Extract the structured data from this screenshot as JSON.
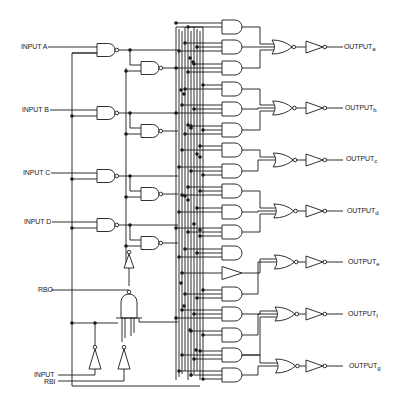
{
  "diagram": {
    "type": "logic-schematic",
    "inputs": [
      {
        "id": "A",
        "label": "INPUT A",
        "y": 47
      },
      {
        "id": "B",
        "label": "INPUT B",
        "y": 110
      },
      {
        "id": "C",
        "label": "INPUT C",
        "y": 173
      },
      {
        "id": "D",
        "label": "INPUT D",
        "y": 222
      }
    ],
    "rbo": {
      "label": "RBO",
      "y": 290
    },
    "rbi": {
      "label_line1": "INPUT",
      "label_line2": "RBI",
      "y1": 375,
      "y2": 381
    },
    "outputs": [
      {
        "id": "a",
        "prefix": "OUTPUT",
        "sub": "a",
        "y": 47
      },
      {
        "id": "b",
        "prefix": "OUTPUT",
        "sub": "b",
        "y": 108
      },
      {
        "id": "c",
        "prefix": "OUTPUT",
        "sub": "c",
        "y": 160
      },
      {
        "id": "d",
        "prefix": "OUTPUT",
        "sub": "d",
        "y": 211
      },
      {
        "id": "e",
        "prefix": "OUTPUT",
        "sub": "e",
        "y": 262
      },
      {
        "id": "f",
        "prefix": "OUTPUT",
        "sub": "f",
        "y": 314
      },
      {
        "id": "g",
        "prefix": "OUTPUT",
        "sub": "g",
        "y": 366
      }
    ],
    "and_gate_rows": [
      27,
      47,
      68,
      89,
      109,
      130,
      150,
      171,
      191,
      212,
      232,
      253,
      273,
      294,
      314,
      335,
      355,
      375
    ],
    "buffer_row_index": 12,
    "nor_groups": [
      {
        "output": "a",
        "rows": [
          0,
          1,
          2
        ]
      },
      {
        "output": "b",
        "rows": [
          3,
          4,
          5
        ]
      },
      {
        "output": "c",
        "rows": [
          6,
          7
        ]
      },
      {
        "output": "d",
        "rows": [
          8,
          9,
          10
        ]
      },
      {
        "output": "e",
        "rows": [
          12,
          13
        ]
      },
      {
        "output": "f",
        "rows": [
          14,
          15,
          16
        ]
      },
      {
        "output": "g",
        "rows": [
          16,
          17
        ]
      }
    ]
  }
}
